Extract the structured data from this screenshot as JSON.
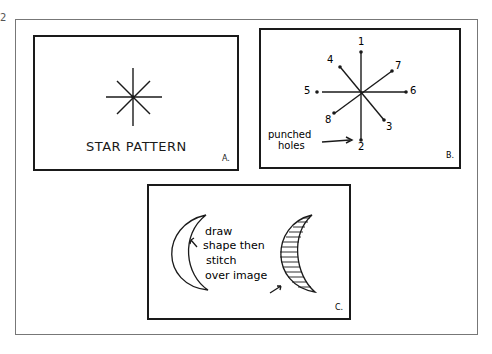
{
  "page_number": "2",
  "panels": [
    {
      "id": "A",
      "label": "A.",
      "caption": "STAR PATTERN"
    },
    {
      "id": "B",
      "label": "B.",
      "hole_numbers": [
        "1",
        "2",
        "3",
        "4",
        "5",
        "6",
        "7",
        "8"
      ],
      "annotation_line1": "punched",
      "annotation_line2": "holes"
    },
    {
      "id": "C",
      "label": "C.",
      "note_lines": [
        "draw",
        "shape then",
        "stitch",
        "over image"
      ]
    }
  ]
}
